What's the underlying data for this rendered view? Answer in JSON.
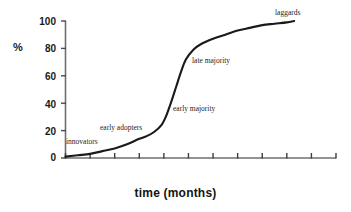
{
  "chart_data": {
    "type": "line",
    "title": "",
    "subtitle": "",
    "xlabel": "time (months)",
    "ylabel": "%",
    "xlim": [
      0,
      11
    ],
    "ylim": [
      0,
      100
    ],
    "grid": false,
    "legend_position": "none",
    "y_ticks": [
      0,
      20,
      40,
      60,
      80,
      100
    ],
    "y_tick_labels": [
      "0",
      "20",
      "40",
      "60",
      "80",
      "100"
    ],
    "x_ticks": [
      0,
      1,
      2,
      3,
      4,
      5,
      6,
      7,
      8,
      9,
      10,
      11
    ],
    "x_tick_labels": [
      "",
      "",
      "",
      "",
      "",
      "",
      "",
      "",
      "",
      "",
      "",
      ""
    ],
    "series": [
      {
        "name": "cumulative adoption",
        "x": [
          0.0,
          0.5,
          1.0,
          1.5,
          2.0,
          2.5,
          3.0,
          3.3,
          3.6,
          3.9,
          4.1,
          4.3,
          4.5,
          4.7,
          4.9,
          5.2,
          5.5,
          6.0,
          6.5,
          7.0,
          7.5,
          8.0,
          8.5,
          9.0,
          9.3
        ],
        "y": [
          1,
          2,
          3,
          5,
          7,
          10,
          14,
          16,
          19,
          24,
          31,
          41,
          52,
          63,
          72,
          79,
          83,
          87,
          90,
          93,
          95,
          97,
          98,
          99,
          100
        ]
      }
    ],
    "annotations": [
      {
        "text": "innovators",
        "x": 0.15,
        "y": 8
      },
      {
        "text": "early adopters",
        "x": 1.45,
        "y": 21
      },
      {
        "text": "early majority",
        "x": 4.35,
        "y": 44
      },
      {
        "text": "late majority",
        "x": 5.1,
        "y": 78
      },
      {
        "text": "laggards",
        "x": 8.2,
        "y": 106
      }
    ]
  },
  "chart": {
    "y_axis_title": "%",
    "x_axis_title": "time (months)",
    "y_tick_labels": [
      "100",
      "80",
      "60",
      "40",
      "20",
      "0"
    ],
    "annotations": [
      "innovators",
      "early adopters",
      "early majority",
      "late majority",
      "laggards"
    ],
    "colors": {
      "curve": "#1a1a1a",
      "axis": "#6f6f6f",
      "text": "#1a1a1a",
      "background": "#ffffff"
    }
  }
}
